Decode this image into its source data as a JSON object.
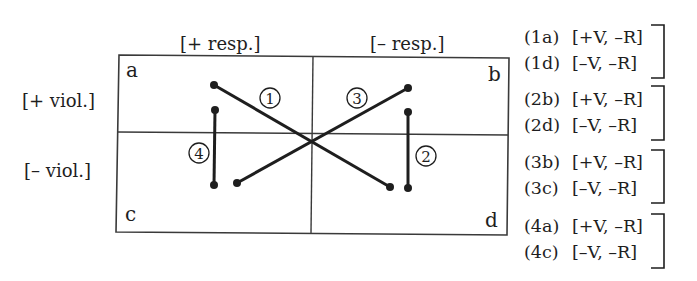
{
  "column_headers": [
    "[+ resp.]",
    "[– resp.]"
  ],
  "row_headers": [
    "[+ viol.]",
    "[– viol.]"
  ],
  "corners": {
    "a": "a",
    "b": "b",
    "c": "c",
    "d": "d"
  },
  "markers": {
    "m1": "1",
    "m2": "2",
    "m3": "3",
    "m4": "4"
  },
  "legend": [
    {
      "group": 1,
      "rows": [
        {
          "code": "(1a)",
          "features": "[+V, –R]"
        },
        {
          "code": "(1d)",
          "features": "[–V, –R]"
        }
      ]
    },
    {
      "group": 2,
      "rows": [
        {
          "code": "(2b)",
          "features": "[+V, –R]"
        },
        {
          "code": "(2d)",
          "features": "[–V, –R]"
        }
      ]
    },
    {
      "group": 3,
      "rows": [
        {
          "code": "(3b)",
          "features": "[+V, –R]"
        },
        {
          "code": "(3c)",
          "features": "[–V, –R]"
        }
      ]
    },
    {
      "group": 4,
      "rows": [
        {
          "code": "(4a)",
          "features": "[+V, –R]"
        },
        {
          "code": "(4c)",
          "features": "[–V, –R]"
        }
      ]
    }
  ],
  "colors": {
    "ink": "#1e1e1e",
    "frame": "#3a3a3a",
    "background": "#ffffff"
  }
}
